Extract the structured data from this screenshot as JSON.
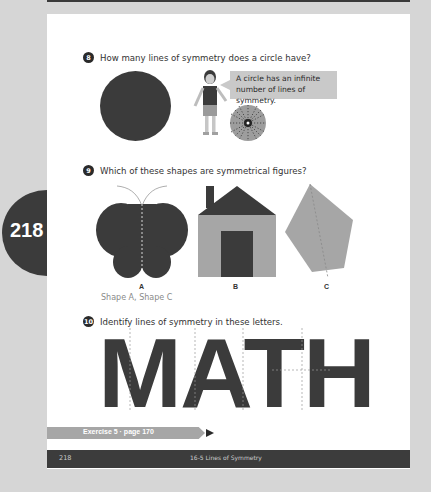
{
  "page_tab": {
    "number": "218"
  },
  "questions": [
    {
      "number": "8",
      "text": "How many lines of symmetry does a circle have?"
    },
    {
      "number": "9",
      "text": "Which of these shapes are symmetrical figures?"
    },
    {
      "number": "10",
      "text": "Identify lines of symmetry in these letters."
    }
  ],
  "speech_bubble": {
    "line1": "A circle has an infinite",
    "line2": "number of lines of symmetry."
  },
  "shapes": {
    "labels": [
      "A",
      "B",
      "C"
    ],
    "names": [
      "butterfly",
      "house",
      "pentagon"
    ]
  },
  "answer_q9": "Shape A, Shape C",
  "letters": "MATH",
  "exercise_ref": "Exercise 5 · page 170",
  "footer": {
    "page": "218",
    "chapter": "16-5 Lines of Symmetry"
  },
  "colors": {
    "dark": "#3b3b3b",
    "medium": "#a6a6a6",
    "light": "#c9c9c9",
    "background": "#d6d6d6"
  }
}
